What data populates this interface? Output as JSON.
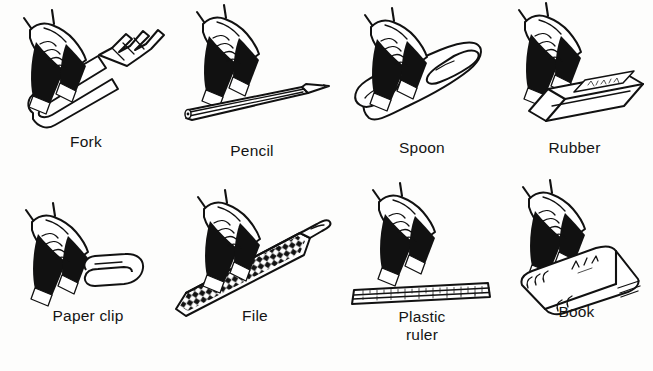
{
  "sheet": {
    "title": "Hand grip illustrations of everyday objects",
    "background_color": "#fdfdfc",
    "ink_color": "#111111",
    "columns": 4,
    "rows": 2
  },
  "items": [
    {
      "id": "fork",
      "label": "Fork",
      "object_icon": "fork-icon",
      "hand_icon": "hand-grip-icon",
      "row": 1,
      "column": 1
    },
    {
      "id": "pencil",
      "label": "Pencil",
      "object_icon": "pencil-icon",
      "hand_icon": "hand-grip-icon",
      "row": 1,
      "column": 2
    },
    {
      "id": "spoon",
      "label": "Spoon",
      "object_icon": "spoon-icon",
      "hand_icon": "hand-grip-icon",
      "row": 1,
      "column": 3
    },
    {
      "id": "rubber",
      "label": "Rubber",
      "object_icon": "eraser-icon",
      "hand_icon": "hand-grip-icon",
      "row": 1,
      "column": 4
    },
    {
      "id": "paper-clip",
      "label": "Paper clip",
      "object_icon": "paper-clip-icon",
      "hand_icon": "hand-grip-icon",
      "row": 2,
      "column": 1
    },
    {
      "id": "file",
      "label": "File",
      "object_icon": "file-tool-icon",
      "hand_icon": "hand-grip-icon",
      "row": 2,
      "column": 2
    },
    {
      "id": "plastic-ruler",
      "label": "Plastic\nruler",
      "object_icon": "ruler-icon",
      "hand_icon": "hand-grip-icon",
      "row": 2,
      "column": 3
    },
    {
      "id": "book",
      "label": "Book",
      "object_icon": "book-icon",
      "hand_icon": "hand-grip-icon",
      "row": 2,
      "column": 4
    }
  ]
}
